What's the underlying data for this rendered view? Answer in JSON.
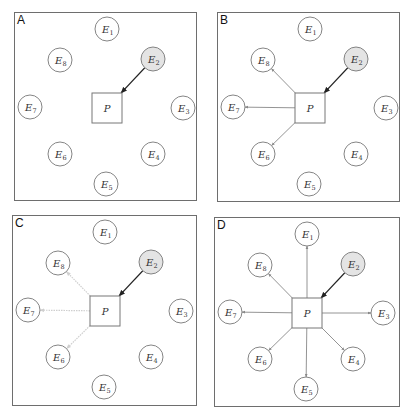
{
  "figure": {
    "colors": {
      "border": "#6e6e6e",
      "node_stroke": "#777777",
      "highlight_fill": "#e4e4e4",
      "incoming_arrow": "#222222",
      "outgoing_arrow": "#888888",
      "faded_arrow": "#cfcfcf"
    },
    "center_node": {
      "label": "P",
      "shape": "square"
    },
    "highlighted_node": "E2",
    "nodes": [
      {
        "id": "E1",
        "base": "E",
        "sub": "1"
      },
      {
        "id": "E2",
        "base": "E",
        "sub": "2"
      },
      {
        "id": "E3",
        "base": "E",
        "sub": "3"
      },
      {
        "id": "E4",
        "base": "E",
        "sub": "4"
      },
      {
        "id": "E5",
        "base": "E",
        "sub": "5"
      },
      {
        "id": "E6",
        "base": "E",
        "sub": "6"
      },
      {
        "id": "E7",
        "base": "E",
        "sub": "7"
      },
      {
        "id": "E8",
        "base": "E",
        "sub": "8"
      }
    ],
    "panels": [
      {
        "label": "A",
        "incoming": [
          "E2"
        ],
        "outgoing": [],
        "outgoing_style": "none"
      },
      {
        "label": "B",
        "incoming": [
          "E2"
        ],
        "outgoing": [
          "E8",
          "E7",
          "E6"
        ],
        "outgoing_style": "solid"
      },
      {
        "label": "C",
        "incoming": [
          "E2"
        ],
        "outgoing": [
          "E8",
          "E7",
          "E6"
        ],
        "outgoing_style": "faded-dotted"
      },
      {
        "label": "D",
        "incoming": [
          "E2"
        ],
        "outgoing": [
          "E1",
          "E3",
          "E4",
          "E5",
          "E6",
          "E7",
          "E8"
        ],
        "outgoing_style": "solid"
      }
    ]
  }
}
